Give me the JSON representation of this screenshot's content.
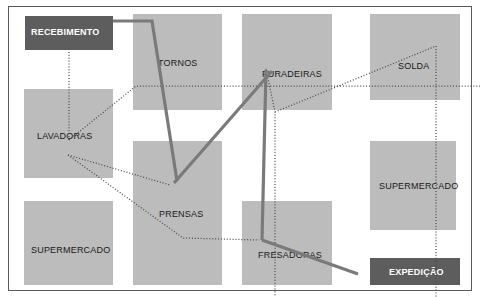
{
  "diagram": {
    "frame": {
      "x": 8,
      "y": 6,
      "width": 464,
      "height": 285,
      "border_color": "#5a5a5a"
    },
    "colors": {
      "background": "#ffffff",
      "area_light": "#bcbcbc",
      "area_dark": "#5d5d5d",
      "label_light": "#1a1a1a",
      "label_dark": "#ffffff",
      "thick_flow": "#7a7a7a",
      "dotted_flow": "#4a4a4a"
    },
    "areas": [
      {
        "id": "recebimento",
        "label": "RECEBIMENTO",
        "style": "dark",
        "x": 25,
        "y": 16,
        "width": 88,
        "height": 34,
        "label_x": 31,
        "label_y": 28
      },
      {
        "id": "tornos",
        "label": "TORNOS",
        "style": "light",
        "x": 133,
        "y": 14,
        "width": 89,
        "height": 96,
        "label_x": 158,
        "label_y": 59
      },
      {
        "id": "furadeiras",
        "label": "FURADEIRAS",
        "style": "light",
        "x": 242,
        "y": 14,
        "width": 90,
        "height": 96,
        "label_x": 262,
        "label_y": 70
      },
      {
        "id": "solda",
        "label": "SOLDA",
        "style": "light",
        "x": 370,
        "y": 14,
        "width": 90,
        "height": 86,
        "label_x": 398,
        "label_y": 62
      },
      {
        "id": "lavadoras",
        "label": "LAVADORAS",
        "style": "light",
        "x": 24,
        "y": 89,
        "width": 89,
        "height": 89,
        "label_x": 37,
        "label_y": 132
      },
      {
        "id": "prensas",
        "label": "PRENSAS",
        "style": "light",
        "x": 133,
        "y": 141,
        "width": 89,
        "height": 144,
        "label_x": 159,
        "label_y": 210
      },
      {
        "id": "supermercado-dir",
        "label": "SUPERMERCADO",
        "style": "light",
        "x": 370,
        "y": 141,
        "width": 86,
        "height": 89,
        "label_x": 379,
        "label_y": 182
      },
      {
        "id": "supermercado-esq",
        "label": "SUPERMERCADO",
        "style": "light",
        "x": 24,
        "y": 201,
        "width": 89,
        "height": 84,
        "label_x": 31,
        "label_y": 246
      },
      {
        "id": "fresadoras",
        "label": "FRESADORAS",
        "style": "light",
        "x": 242,
        "y": 201,
        "width": 90,
        "height": 84,
        "label_x": 258,
        "label_y": 251
      },
      {
        "id": "expedicao",
        "label": "EXPEDIÇÃO",
        "style": "dark",
        "x": 370,
        "y": 258,
        "width": 90,
        "height": 27,
        "label_x": 389,
        "label_y": 268
      }
    ],
    "flows": {
      "thick": [
        {
          "id": "flow-recebimento-tornos-prensas",
          "points": "113,21 152,21 177,181"
        },
        {
          "id": "flow-furadeiras-prensas",
          "points": "272,71 174,183"
        },
        {
          "id": "flow-furadeiras-fresadoras",
          "points": "266,70 262,240"
        },
        {
          "id": "flow-fresadoras-expedicao",
          "points": "262,240 358,274"
        }
      ],
      "dotted": [
        {
          "id": "dot-recebimento-lavadoras",
          "points": "69,49 69,140"
        },
        {
          "id": "dot-lavadoras-tornos-solda",
          "points": "69,140 136,86 480,86"
        },
        {
          "id": "dot-lavadoras-prensas",
          "points": "68,155 170,185"
        },
        {
          "id": "dot-lavadoras-prensas-fresadoras",
          "points": "68,155 183,238 259,240"
        },
        {
          "id": "dot-furadeiras-solda-right",
          "points": "266,69 275,112 275,297"
        },
        {
          "id": "dot-solda-vertical",
          "points": "436,46 436,297"
        },
        {
          "id": "dot-furadeiras-to-solda",
          "points": "275,112 436,46"
        }
      ]
    }
  }
}
